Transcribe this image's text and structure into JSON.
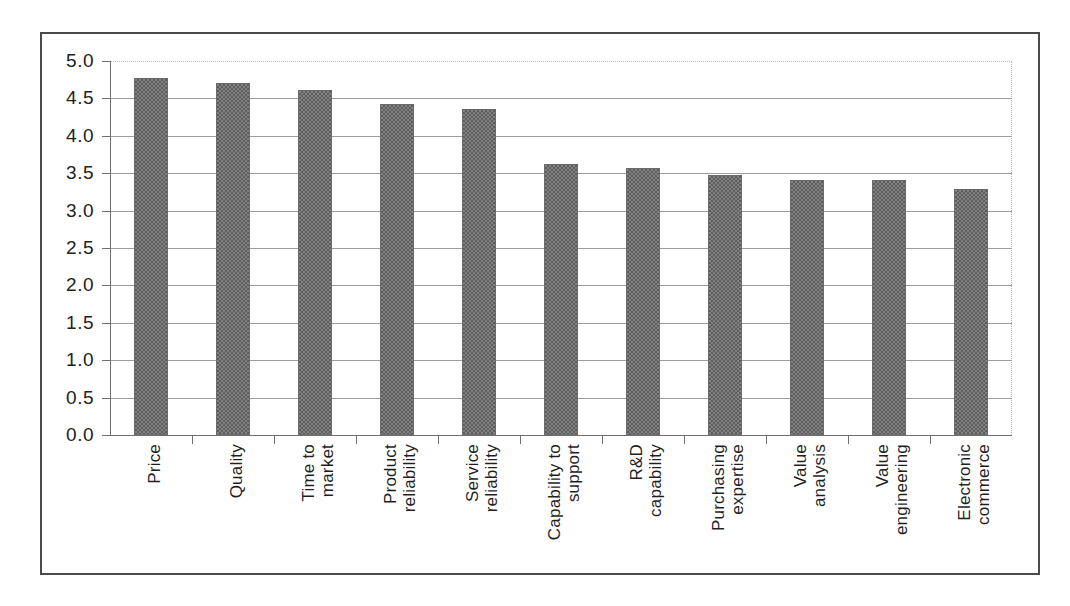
{
  "chart_data": {
    "type": "bar",
    "title": "",
    "subtitle": "",
    "xlabel": "",
    "ylabel": "",
    "ylim": [
      0.0,
      5.0
    ],
    "ytick_step": 0.5,
    "grid": true,
    "legend": false,
    "legend_position": "none",
    "orientation": "vertical",
    "bar_color": "#808080",
    "bar_pattern": "50-percent-checker-dither",
    "categories": [
      "Price",
      "Quality",
      "Time to market",
      "Product reliability",
      "Service reliability",
      "Capability to support",
      "R&D capability",
      "Purchasing expertise",
      "Value analysis",
      "Value engineering",
      "Electronic commerce"
    ],
    "category_lines": [
      [
        "Price"
      ],
      [
        "Quality"
      ],
      [
        "Time to",
        "market"
      ],
      [
        "Product",
        "reliability"
      ],
      [
        "Service",
        "reliability"
      ],
      [
        "Capability to",
        "support"
      ],
      [
        "R&D",
        "capability"
      ],
      [
        "Purchasing",
        "expertise"
      ],
      [
        "Value",
        "analysis"
      ],
      [
        "Value",
        "engineering"
      ],
      [
        "Electronic",
        "commerce"
      ]
    ],
    "values": [
      4.77,
      4.71,
      4.61,
      4.43,
      4.36,
      3.62,
      3.57,
      3.47,
      3.41,
      3.41,
      3.29
    ],
    "ytick_labels": [
      "5.0",
      "4.5",
      "4.0",
      "3.5",
      "3.0",
      "2.5",
      "2.0",
      "1.5",
      "1.0",
      "0.5",
      "0.0"
    ],
    "ytick_values": [
      5.0,
      4.5,
      4.0,
      3.5,
      3.0,
      2.5,
      2.0,
      1.5,
      1.0,
      0.5,
      0.0
    ]
  },
  "figure": {
    "border_color": "#4a4a4a",
    "background": "#ffffff",
    "gridline_color": "#9d9d9d",
    "axis_color": "#6f6f6f"
  }
}
